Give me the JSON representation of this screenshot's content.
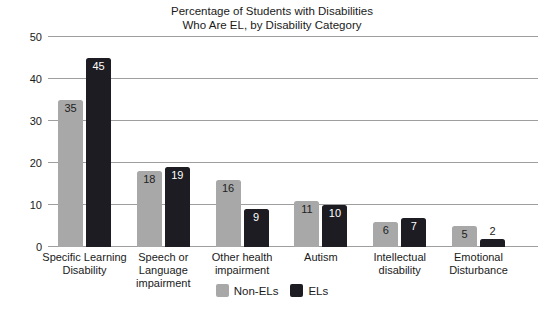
{
  "chart_data": {
    "type": "bar",
    "title": "Percentage of Students with Disabilities Who Are EL, by Disability Category",
    "title_lines": [
      "Percentage of Students with Disabilities",
      "Who Are EL, by Disability Category"
    ],
    "categories": [
      "Specific Learning\nDisability",
      "Speech or\nLanguage\nimpairment",
      "Other health\nimpairment",
      "Autism",
      "Intellectual\ndisability",
      "Emotional\nDisturbance"
    ],
    "series": [
      {
        "name": "Non-ELs",
        "color": "#a8a8a8",
        "label_color": "#222222",
        "values": [
          35,
          18,
          16,
          11,
          6,
          5
        ]
      },
      {
        "name": "ELs",
        "color": "#1c1c22",
        "label_color": "#ffffff",
        "values": [
          45,
          19,
          9,
          10,
          7,
          2
        ]
      }
    ],
    "y_ticks": [
      0,
      10,
      20,
      30,
      40,
      50
    ],
    "ylim": [
      0,
      50
    ],
    "grid": true,
    "gridline_color": "#9e9e9e",
    "legend_position": "bottom",
    "xlabel": "",
    "ylabel": ""
  }
}
